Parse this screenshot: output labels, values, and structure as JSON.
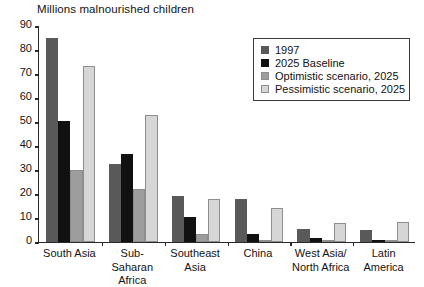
{
  "chart_data": {
    "type": "bar",
    "title": "Millions malnourished children",
    "xlabel": "",
    "ylabel": "",
    "ylim": [
      0,
      90
    ],
    "yticks": [
      0,
      10,
      20,
      30,
      40,
      50,
      60,
      70,
      80,
      90
    ],
    "grid": false,
    "legend_position": "top-right",
    "categories": [
      "South Asia",
      "Sub-Saharan\nAfrica",
      "Southeast\nAsia",
      "China",
      "West Asia/\nNorth Africa",
      "Latin\nAmerica"
    ],
    "series": [
      {
        "name": "1997",
        "color": "#595959",
        "values": [
          85,
          32.5,
          19,
          18,
          5.5,
          5
        ]
      },
      {
        "name": "2025 Baseline",
        "color": "#111111",
        "values": [
          50.5,
          36.5,
          10.5,
          3.5,
          1.5,
          0.7
        ]
      },
      {
        "name": "Optimistic scenario, 2025",
        "color": "#9d9d9d",
        "values": [
          30,
          22,
          3.5,
          0.4,
          0.4,
          0.3
        ]
      },
      {
        "name": "Pessimistic scenario, 2025",
        "color": "#d6d6d6",
        "values": [
          73.5,
          53,
          18,
          14,
          8,
          8.5
        ]
      }
    ]
  },
  "legend": {
    "items": [
      {
        "label": "1997",
        "color": "#595959"
      },
      {
        "label": "2025 Baseline",
        "color": "#111111"
      },
      {
        "label": "Optimistic scenario, 2025",
        "color": "#9d9d9d"
      },
      {
        "label": "Pessimistic scenario, 2025",
        "color": "#d6d6d6"
      }
    ]
  }
}
